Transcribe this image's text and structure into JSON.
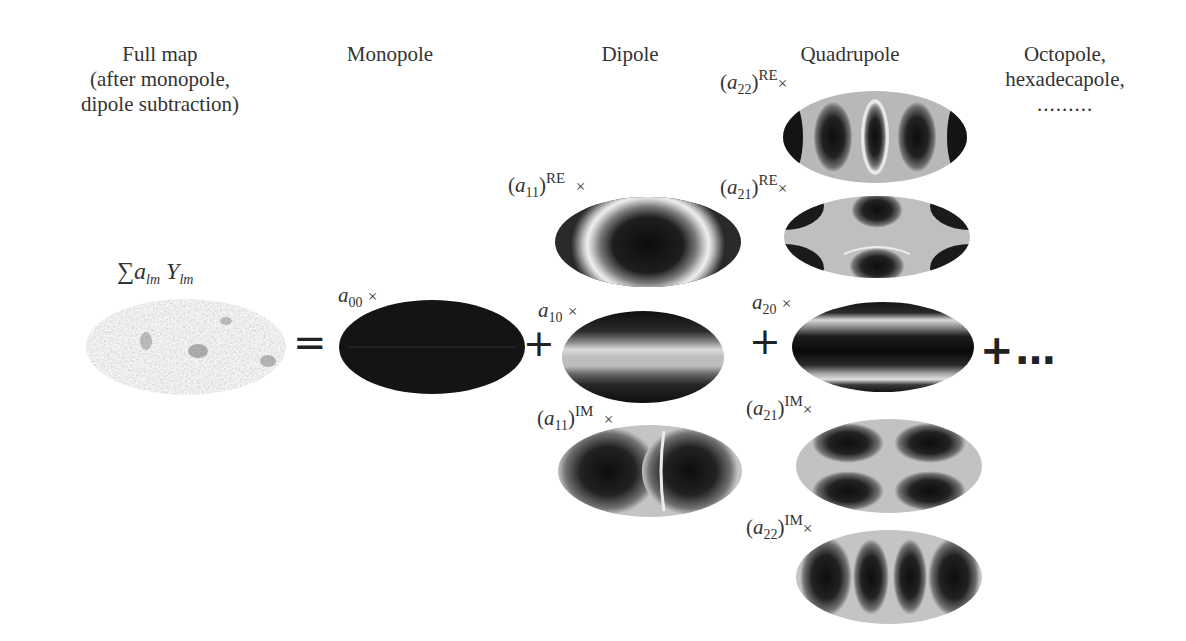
{
  "columns": {
    "full_map": {
      "line1": "Full map",
      "line2": "(after monopole,",
      "line3": "dipole subtraction)"
    },
    "monopole": "Monopole",
    "dipole": "Dipole",
    "quadrupole": "Quadrupole",
    "higher": {
      "line1": "Octopole,",
      "line2": "hexadecapole,",
      "line3": "........."
    }
  },
  "equation": {
    "sum_label": {
      "sigma": "∑",
      "a": "a",
      "a_sub": "lm",
      "Y": "Y",
      "Y_sub": "lm"
    },
    "equals": "=",
    "plus": "+",
    "ellipsis": "+…"
  },
  "coefficients": {
    "a00": {
      "base": "a",
      "sub": "00",
      "times": "×"
    },
    "a11_re": {
      "open": "(",
      "base": "a",
      "sub": "11",
      "close": ")",
      "sup": "RE",
      "times": "×"
    },
    "a10": {
      "base": "a",
      "sub": "10",
      "times": "×"
    },
    "a11_im": {
      "open": "(",
      "base": "a",
      "sub": "11",
      "close": ")",
      "sup": "IM",
      "times": "×"
    },
    "a22_re": {
      "open": "(",
      "base": "a",
      "sub": "22",
      "close": ")",
      "sup": "RE",
      "times": "×"
    },
    "a21_re": {
      "open": "(",
      "base": "a",
      "sub": "21",
      "close": ")",
      "sup": "RE",
      "times": "×"
    },
    "a20": {
      "base": "a",
      "sub": "20",
      "times": "×"
    },
    "a21_im": {
      "open": "(",
      "base": "a",
      "sub": "21",
      "close": ")",
      "sup": "IM",
      "times": "×"
    },
    "a22_im": {
      "open": "(",
      "base": "a",
      "sub": "22",
      "close": ")",
      "sup": "IM",
      "times": "×"
    }
  },
  "colors": {
    "dark": "#111111",
    "light": "#c8c8c8",
    "ring": "#e6e6e6",
    "cmb": "#b5b5b5"
  }
}
